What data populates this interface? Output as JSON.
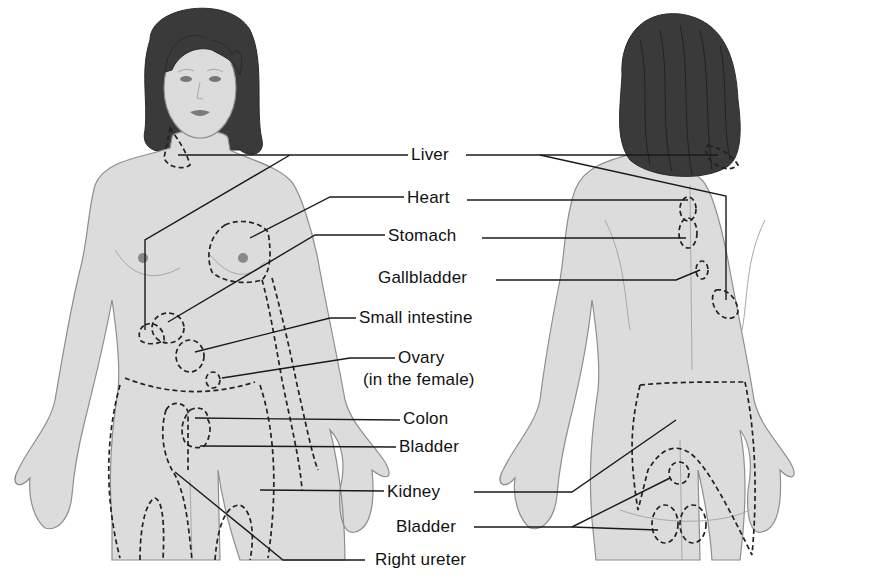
{
  "figure": {
    "views": [
      "front",
      "back"
    ]
  },
  "labels": {
    "liver": "Liver",
    "heart": "Heart",
    "stomach": "Stomach",
    "gallbladder": "Gallbladder",
    "small_intestine": "Small intestine",
    "ovary_line1": "Ovary",
    "ovary_line2": "(in the female)",
    "colon": "Colon",
    "bladder_front": "Bladder",
    "kidney": "Kidney",
    "bladder_back": "Bladder",
    "right_ureter": "Right ureter"
  },
  "colors": {
    "skin": "#dcdcdc",
    "outline": "#8e8e8e",
    "hair": "#3a3a3a",
    "dashed_region": "#222222",
    "leader_line": "#1a1a1a",
    "background": "#ffffff"
  }
}
